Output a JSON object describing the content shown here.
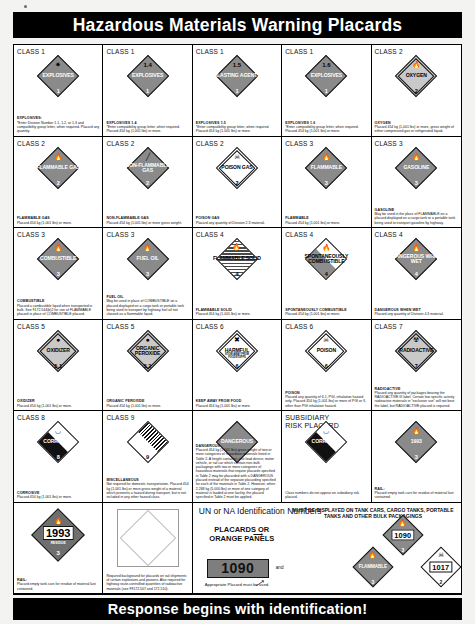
{
  "header": {
    "title": "Hazardous Materials Warning Placards"
  },
  "footer": {
    "title": "Response begins with identification!"
  },
  "placards": [
    {
      "class_label": "CLASS 1",
      "name": "EXPLOSIVES",
      "division": "1",
      "note_title": "EXPLOSIVES:",
      "note": "*Enter Division Number 1.1, 1.2, or 1.3 and compatibility group letter, when required.  Placard any quantity.",
      "icon": "explosion-icon",
      "color": "#f5821f"
    },
    {
      "class_label": "CLASS 1",
      "name": "EXPLOSIVES",
      "top": "1.4",
      "division": "1",
      "note_title": "EXPLOSIVES 1.4",
      "note": "*Enter compatibility group letter, when required. Placard 454 kg (1,001 lbs) or more.",
      "icon": "none",
      "color": "#f5821f"
    },
    {
      "class_label": "CLASS 1",
      "name": "BLASTING AGENTS",
      "top": "1.5",
      "division": "1",
      "note_title": "EXPLOSIVES 1.5",
      "note": "*Enter compatibility group letter, when required. Placard 454 kg (1,001 lbs) or more.",
      "icon": "none",
      "color": "#f5821f"
    },
    {
      "class_label": "CLASS 1",
      "name": "EXPLOSIVES",
      "top": "1.6",
      "division": "1",
      "note_title": "EXPLOSIVES 1.6",
      "note": "*Enter compatibility group letter, when required. Placard 454 kg (1,001 lbs) or more.",
      "icon": "none",
      "color": "#f5821f"
    },
    {
      "class_label": "CLASS 2",
      "name": "OXYGEN",
      "division": "2",
      "note_title": "OXYGEN",
      "note": "Placard 454 kg (1,001 lbs) or more, gross weight of either compressed gas or refrigerated liquid.",
      "icon": "flame-icon",
      "color": "#ffd400"
    },
    {
      "class_label": "CLASS 2",
      "name": "FLAMMABLE GAS",
      "division": "2",
      "note_title": "FLAMMABLE GAS",
      "note": "Placard 454 kg (1,001 lbs) or more.",
      "icon": "flame-icon",
      "color": "#ed1c24"
    },
    {
      "class_label": "CLASS 2",
      "name": "NON-FLAMMABLE GAS",
      "division": "2",
      "note_title": "NON-FLAMMABLE GAS",
      "note": "Placard 454 kg (1,001 lbs) or more gross weight.",
      "icon": "gas-cylinder-icon",
      "color": "#00a650"
    },
    {
      "class_label": "CLASS 2",
      "name": "POISON GAS",
      "division": "2",
      "note_title": "POISON GAS",
      "note": "Placard any quantity of Division 2.3 material.",
      "icon": "skull-crossbones-icon",
      "color": "#ffffff"
    },
    {
      "class_label": "CLASS 3",
      "name": "FLAMMABLE",
      "division": "3",
      "note_title": "FLAMMABLE",
      "note": "Placard 454 kg (1,001 lbs) or more.",
      "icon": "flame-icon",
      "color": "#ed1c24"
    },
    {
      "class_label": "CLASS 3",
      "name": "GASOLINE",
      "division": "3",
      "note_title": "GASOLINE",
      "note": "May be used in the place of FLAMMABLE on a placard displayed on a cargo tank or a portable tank being used to transport gasoline by highway.",
      "icon": "flame-icon",
      "color": "#ed1c24"
    },
    {
      "class_label": "CLASS 3",
      "name": "COMBUSTIBLE",
      "division": "3",
      "note_title": "COMBUSTIBLE",
      "note": "Placard a combustible liquid when transported in bulk.  See §172.544(b)2 for use of FLAMMABLE placard in place of COMBUSTIBLE placard.",
      "icon": "flame-icon",
      "color": "#ed1c24"
    },
    {
      "class_label": "CLASS 3",
      "name": "FUEL OIL",
      "division": "3",
      "note_title": "FUEL OIL",
      "note": "May be used in place of COMBUSTIBLE on a placard displayed on a cargo tank or portable tank being used to transport by highway fuel oil not classed as a flammable liquid.",
      "icon": "flame-icon",
      "color": "#ed1c24"
    },
    {
      "class_label": "CLASS 4",
      "name": "FLAMMABLE SOLID",
      "division": "4",
      "note_title": "FLAMMABLE SOLID",
      "note": "Placard 454 kg (1,001 lbs) or more.",
      "icon": "flame-icon",
      "color": "#ffffff"
    },
    {
      "class_label": "CLASS 4",
      "name": "SPONTANEOUSLY COMBUSTIBLE",
      "division": "4",
      "note_title": "SPONTANEOUSLY COMBUSTIBLE",
      "note": "Placard 454 kg (1,001 lbs) or more.",
      "icon": "flame-icon",
      "color": "#ffffff"
    },
    {
      "class_label": "CLASS 4",
      "name": "DANGEROUS WHEN WET",
      "division": "4",
      "note_title": "DANGEROUS WHEN WET",
      "note": "Placard any quantity of Division 4.3 material.",
      "icon": "flame-icon",
      "color": "#0033a0"
    },
    {
      "class_label": "CLASS 5",
      "name": "OXIDIZER",
      "division": "5.1",
      "note_title": "OXIDIZER",
      "note": "Placard 454 kg (1,001 lbs) or more.",
      "icon": "oxidizer-flame-icon",
      "color": "#ffd400"
    },
    {
      "class_label": "CLASS 5",
      "name": "ORGANIC PEROXIDE",
      "division": "5.2",
      "note_title": "ORGANIC PEROXIDE",
      "note": "Placard 454 kg (1,001 lbs) or more.",
      "icon": "oxidizer-flame-icon",
      "color": "#ffd400"
    },
    {
      "class_label": "CLASS 6",
      "name": "HARMFUL",
      "division": "6",
      "sub": "STOW AWAY FROM FOODSTUFFS",
      "note_title": "KEEP AWAY FROM FOOD",
      "note": "Placard 454 kg (1,001 lbs) or more.",
      "icon": "crossed-bones-icon",
      "color": "#ffffff"
    },
    {
      "class_label": "CLASS 6",
      "name": "POISON",
      "division": "6",
      "note_title": "POISON",
      "note": "Placard any quantity of 6.1, PGI, inhalation hazard only.  Placard 454 kg (1,001 lbs) or more of PGI or II, other than PGI inhalation hazard.",
      "icon": "skull-crossbones-icon",
      "color": "#ffffff"
    },
    {
      "class_label": "CLASS 7",
      "name": "RADIOACTIVE",
      "division": "7",
      "note_title": "RADIOACTIVE",
      "note": "Placard any quantity of packages bearing the RADIOACTIVE III label.  Certain low specific activity radioactive materials in \"exclusive use\" will not bear the label, but RADIOACTIVE placard is required.",
      "icon": "trefoil-icon",
      "color": "#ffd400"
    },
    {
      "class_label": "CLASS 8",
      "name": "CORROSIVE",
      "division": "8",
      "note_title": "CORROSIVE",
      "note": "Placard 454 kg (1,001 lbs) or more.",
      "icon": "corrosion-icon",
      "color": "#000000"
    },
    {
      "class_label": "CLASS 9",
      "name": "",
      "division": "9",
      "note_title": "MISCELLANEOUS",
      "note": "Not required for domestic transportation. Placard 454 kg (1,001 lbs) or more gross weight of a material which presents a hazard during transport, but is not included in any other hazard class.",
      "icon": "stripes-icon",
      "color": "#ffffff"
    },
    {
      "class_label": "",
      "name": "DANGEROUS",
      "division": "",
      "note_title": "DANGEROUS",
      "note": "Placard 454 kg (1,001 lbs) gross weight of two or more categories of hazardous materials listed in Table 2.  A freight container, unit load device, motor vehicle, or rail car which contain non-bulk packagings with two or more categories of hazardous materials that require placards specified in Table 2 may  be placarded with a DANGEROUS placard instead of the separate placarding specified for each of the materials in Table 2.  However, when 2,268 kg (5,000 lbs) or more of one category of material is loaded at one facility, the placard specified in Table 2 must be applied.",
      "icon": "none",
      "color": "#ed1c24"
    },
    {
      "class_label": "SUBSIDIARY RISK PLACARD",
      "name": "CORROSIVE",
      "division": "",
      "note_title": "",
      "note": "Class numbers do not appear on subsidiary risk placard.",
      "icon": "corrosion-icon",
      "color": "#000000"
    },
    {
      "class_label": "",
      "name": "1993",
      "division": "3",
      "resid": "RESIDUE",
      "note_title": "RAIL:",
      "note": "Placard empty tank cars for residue of material last contained.",
      "icon": "flame-icon",
      "color": "#ed1c24"
    },
    {
      "class_label": "",
      "name": "",
      "division": "",
      "note_title": "",
      "note": "Required background for placards on rail shipments of certain explosives and poisons. Also required for highway route-controlled quantities of radioactive materials (see §§172.507 and 172.510).",
      "icon": "blank-background-icon",
      "color": "#ffffff"
    }
  ],
  "unna": {
    "title": "UN or NA Identification Numbers",
    "placards_or": "PLACARDS OR",
    "orange_panels": "ORANGE PANELS",
    "panel_number": "1090",
    "and": "and",
    "appropriate": "Appropriate Placard must be used.",
    "must_display": "MUST BE DISPLAYED ON TANK CARS, CARGO TANKS, PORTABLE TANKS AND OTHER BULK PACKAGINGS",
    "minis": [
      {
        "id": "1090",
        "label": "",
        "division": "3",
        "icon": "flame-icon"
      },
      {
        "id": "",
        "label": "FLAMMABLE",
        "division": "3",
        "icon": "flame-icon"
      },
      {
        "id": "1017",
        "label": "",
        "division": "2",
        "icon": "skull-crossbones-icon"
      },
      {
        "id": "1993",
        "label": "",
        "division": "3",
        "icon": "flame-icon"
      }
    ]
  }
}
